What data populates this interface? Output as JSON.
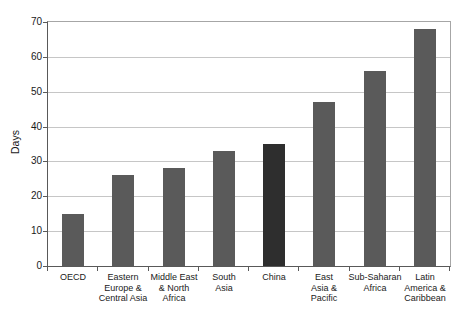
{
  "chart_data": {
    "type": "bar",
    "title": "",
    "xlabel": "",
    "ylabel": "Days",
    "ylim": [
      0,
      70
    ],
    "ytick_step": 10,
    "yticks": [
      0,
      10,
      20,
      30,
      40,
      50,
      60,
      70
    ],
    "grid": true,
    "legend": "none",
    "categories": [
      "OECD",
      "Eastern\nEurope &\nCentral Asia",
      "Middle East\n& North\nAfrica",
      "South\nAsia",
      "China",
      "East\nAsia &\nPacific",
      "Sub-Saharan\nAfrica",
      "Latin\nAmerica &\nCaribbean"
    ],
    "values": [
      15,
      26,
      28,
      33,
      35,
      47,
      56,
      68
    ],
    "highlight_category": "China",
    "colors": {
      "bar": "#5a5a5a",
      "highlight_bar": "#2e2e2e",
      "gridline": "#c6c6c6",
      "axis": "#595959",
      "plot_border": "#a6a6a6",
      "text": "#1a1a1a",
      "background": "#ffffff"
    }
  }
}
